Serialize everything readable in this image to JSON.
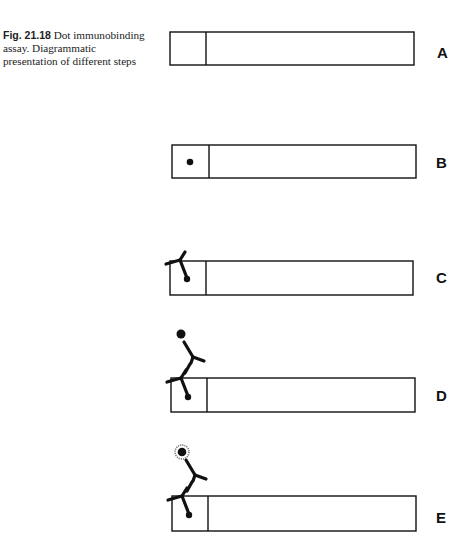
{
  "caption": {
    "figure_number": "Fig. 21.18",
    "text": "Dot immunobinding assay. Diagrammatic presentation of different steps"
  },
  "panels": [
    {
      "label": "A",
      "description": "blank strip"
    },
    {
      "label": "B",
      "description": "antigen dot on strip"
    },
    {
      "label": "C",
      "description": "primary antibody bound to dot"
    },
    {
      "label": "D",
      "description": "enzyme-labelled secondary antibody bound"
    },
    {
      "label": "E",
      "description": "substrate reaction, colored product halo"
    }
  ],
  "colors": {
    "ink": "#111111",
    "background": "#ffffff"
  }
}
